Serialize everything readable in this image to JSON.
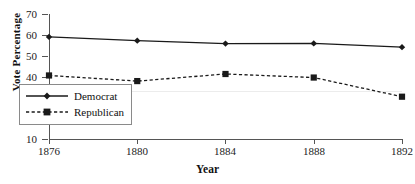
{
  "chart_data": {
    "type": "line",
    "title": "",
    "xlabel": "Year",
    "ylabel": "Vote Percentage",
    "categories": [
      "1876",
      "1880",
      "1884",
      "1888",
      "1892"
    ],
    "series": [
      {
        "name": "Democrat",
        "marker": "diamond",
        "linestyle": "solid",
        "color": "#1a1a1a",
        "values": [
          59.0,
          57.2,
          55.8,
          55.9,
          54.1
        ]
      },
      {
        "name": "Republican",
        "marker": "square",
        "linestyle": "dashed",
        "color": "#1a1a1a",
        "values": [
          40.5,
          37.8,
          41.2,
          39.5,
          30.3
        ]
      }
    ],
    "ylim": [
      10,
      70
    ],
    "yticks": [
      10,
      20,
      30,
      40,
      50,
      60,
      70
    ],
    "ytick_labels": [
      "10",
      "20",
      "30",
      "40",
      "50",
      "60",
      "70"
    ],
    "xlim_categories": 5,
    "grid": "faint-horizontal-near-39",
    "legend_position": "inside lower-left",
    "legend_entries": [
      "Democrat",
      "Republican"
    ]
  }
}
